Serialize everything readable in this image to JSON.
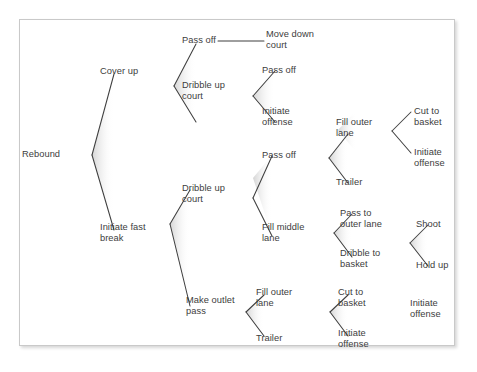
{
  "figure": {
    "type": "decision-tree",
    "frame_border_color": "#c9c9c9",
    "line_color": "#3f3f3f",
    "text_color": "#3d3d3d",
    "background_color": "#ffffff"
  },
  "nodes": {
    "rebound": "Rebound",
    "cover_up": "Cover up",
    "pass_off_1": "Pass off",
    "move_down_court": "Move down\ncourt",
    "dribble_up_court_1": "Dribble up\ncourt",
    "pass_off_2": "Pass off",
    "initiate_offense_1": "Initiate\noffense",
    "initiate_fast_break": "Initiate fast\nbreak",
    "dribble_up_court_2": "Dribble up\ncourt",
    "pass_off_3": "Pass off",
    "fill_outer_lane_1": "Fill outer\nlane",
    "cut_to_basket_1": "Cut to\nbasket",
    "initiate_offense_2": "Initiate\noffense",
    "trailer_1": "Trailer",
    "fill_middle_lane": "Fill middle\nlane",
    "pass_to_outer_lane": "Pass to\nouter lane",
    "dribble_to_basket": "Dribble to\nbasket",
    "shoot": "Shoot",
    "hold_up": "Hold up",
    "make_outlet_pass": "Make outlet\npass",
    "fill_outer_lane_2": "Fill outer\nlane",
    "cut_to_basket_2": "Cut to\nbasket",
    "initiate_offense_3": "Initiate\noffense",
    "trailer_2": "Trailer",
    "initiate_offense_4": "Initiate\noffense"
  },
  "tree": {
    "root": "Rebound",
    "branches": [
      {
        "from": "Rebound",
        "to": [
          "Cover up",
          "Initiate fast break"
        ]
      },
      {
        "from": "Cover up",
        "to": [
          "Pass off",
          "Dribble up court"
        ]
      },
      {
        "from": "Pass off",
        "to": [
          "Move down court"
        ]
      },
      {
        "from": "Dribble up court",
        "to": [
          "Pass off",
          "Initiate offense"
        ]
      },
      {
        "from": "Initiate fast break",
        "to": [
          "Dribble up court",
          "Make outlet pass"
        ]
      },
      {
        "from": "Dribble up court",
        "to": [
          "Pass off",
          "Fill middle lane"
        ]
      },
      {
        "from": "Pass off",
        "to": [
          "Fill outer lane",
          "Trailer"
        ]
      },
      {
        "from": "Fill outer lane",
        "to": [
          "Cut to basket",
          "Initiate offense"
        ]
      },
      {
        "from": "Fill middle lane",
        "to": [
          "Pass to outer lane",
          "Dribble to basket"
        ]
      },
      {
        "from": "Dribble to basket",
        "to": [
          "Shoot",
          "Hold up"
        ]
      },
      {
        "from": "Make outlet pass",
        "to": [
          "Fill outer lane",
          "Trailer"
        ]
      },
      {
        "from": "Fill outer lane",
        "to": [
          "Cut to basket",
          "Initiate offense"
        ]
      }
    ]
  }
}
